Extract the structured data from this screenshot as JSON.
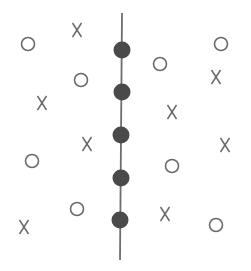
{
  "diagram": {
    "colors": {
      "marker": "#6a6a6a",
      "dot": "#4a4a4a",
      "line": "#6e6e6e",
      "background": "#ffffff"
    },
    "separator": {
      "x_top": 122,
      "x_bottom": 120,
      "y_top": 13,
      "y_bottom": 260
    },
    "dots": [
      {
        "x": 122,
        "y": 50
      },
      {
        "x": 122,
        "y": 92
      },
      {
        "x": 121,
        "y": 135
      },
      {
        "x": 121,
        "y": 178
      },
      {
        "x": 120,
        "y": 220
      }
    ],
    "markers": [
      {
        "type": "O",
        "label": "O",
        "x": 28,
        "y": 44
      },
      {
        "type": "X",
        "label": "X",
        "x": 77,
        "y": 30
      },
      {
        "type": "O",
        "label": "O",
        "x": 81,
        "y": 80
      },
      {
        "type": "X",
        "label": "X",
        "x": 42,
        "y": 103
      },
      {
        "type": "X",
        "label": "X",
        "x": 87,
        "y": 144
      },
      {
        "type": "O",
        "label": "O",
        "x": 32,
        "y": 161
      },
      {
        "type": "O",
        "label": "O",
        "x": 77,
        "y": 209
      },
      {
        "type": "X",
        "label": "X",
        "x": 24,
        "y": 227
      },
      {
        "type": "O",
        "label": "O",
        "x": 221,
        "y": 44
      },
      {
        "type": "O",
        "label": "O",
        "x": 160,
        "y": 64
      },
      {
        "type": "X",
        "label": "X",
        "x": 216,
        "y": 77
      },
      {
        "type": "X",
        "label": "X",
        "x": 172,
        "y": 112
      },
      {
        "type": "X",
        "label": "X",
        "x": 225,
        "y": 145
      },
      {
        "type": "O",
        "label": "O",
        "x": 172,
        "y": 166
      },
      {
        "type": "X",
        "label": "X",
        "x": 165,
        "y": 214
      },
      {
        "type": "O",
        "label": "O",
        "x": 216,
        "y": 225
      }
    ]
  }
}
